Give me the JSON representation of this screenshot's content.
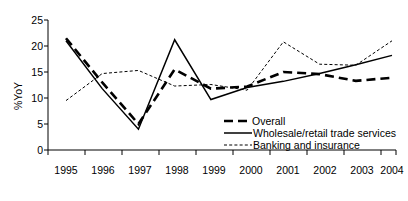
{
  "chart_data": {
    "type": "line",
    "title": "",
    "xlabel": "",
    "ylabel": "%YoY",
    "categories": [
      "1995",
      "1996",
      "1997",
      "1998",
      "1999",
      "2000",
      "2001",
      "2002",
      "2003",
      "2004"
    ],
    "ylim": [
      0,
      25
    ],
    "yticks": [
      0,
      5,
      10,
      15,
      20,
      25
    ],
    "grid": false,
    "legend_position": "inside-bottom-right",
    "series": [
      {
        "name": "Overall",
        "style": "thick-dashed",
        "values": [
          21.5,
          13.0,
          5.0,
          15.5,
          11.8,
          12.2,
          15.0,
          14.6,
          13.3,
          13.9
        ]
      },
      {
        "name": "Wholesale/retail trade services",
        "style": "solid",
        "values": [
          21.0,
          11.8,
          4.0,
          21.2,
          9.7,
          12.0,
          13.2,
          14.7,
          16.4,
          18.2
        ]
      },
      {
        "name": "Banking and insurance",
        "style": "dotted",
        "values": [
          9.5,
          14.7,
          15.3,
          12.3,
          12.6,
          11.5,
          20.8,
          16.5,
          16.3,
          21.0
        ]
      }
    ]
  },
  "axis": {
    "ytick_labels": [
      "25",
      "20",
      "15",
      "10",
      "5",
      "0"
    ],
    "xtick_labels": [
      "1995",
      "1996",
      "1997",
      "1998",
      "1999",
      "2000",
      "2001",
      "2002",
      "2003",
      "2004"
    ],
    "y_axis_title": "%YoY"
  },
  "legend": {
    "items": [
      {
        "label": "Overall"
      },
      {
        "label": "Wholesale/retail trade services"
      },
      {
        "label": "Banking and insurance"
      }
    ]
  }
}
